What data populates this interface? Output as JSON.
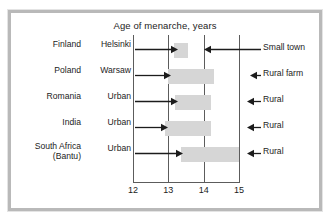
{
  "chart_data": {
    "type": "bar",
    "title": "Age of menarche, years",
    "xlabel": "",
    "ylabel": "",
    "xlim": [
      12,
      15
    ],
    "xticks": [
      12,
      13,
      14,
      15
    ],
    "grid": true,
    "legend_position": "none",
    "orientation": "horizontal",
    "note": "Each horizontal grey bar spans the range of mean menarche age between the urban group (left arrow label) and the rural group (right arrow label).",
    "categories": [
      "Finland",
      "Poland",
      "Romania",
      "India",
      "South Africa (Bantu)"
    ],
    "rows": [
      {
        "country": "Finland",
        "country_sub": "",
        "left_label": "Helsinki",
        "right_label": "Small town",
        "bar_start": 13.15,
        "bar_end": 13.55
      },
      {
        "country": "Poland",
        "country_sub": "",
        "left_label": "Warsaw",
        "right_label": "Rural farm",
        "bar_start": 13.0,
        "bar_end": 14.3
      },
      {
        "country": "Romania",
        "country_sub": "",
        "left_label": "Urban",
        "right_label": "Rural",
        "bar_start": 13.2,
        "bar_end": 14.2
      },
      {
        "country": "India",
        "country_sub": "",
        "left_label": "Urban",
        "right_label": "Rural",
        "bar_start": 12.9,
        "bar_end": 14.2
      },
      {
        "country": "South Africa",
        "country_sub": "(Bantu)",
        "left_label": "Urban",
        "right_label": "Rural",
        "bar_start": 13.35,
        "bar_end": 15.0
      }
    ]
  },
  "colors": {
    "bar_fill": "#d6d6d6",
    "axis": "#5c5c5c",
    "text": "#1c1c1c",
    "frame": "#b9b9b9",
    "background": "#ffffff"
  },
  "ticks": {
    "t0": "12",
    "t1": "13",
    "t2": "14",
    "t3": "15"
  }
}
